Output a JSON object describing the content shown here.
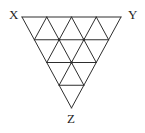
{
  "diagram": {
    "type": "triangular-grid-figure",
    "subdivisions": 4,
    "small_triangle_count": 16,
    "labels": {
      "top_left": "X",
      "top_right": "Y",
      "bottom": "Z"
    },
    "colors": {
      "line": "#2e2e2e",
      "label": "#1f1f1f",
      "background": "#ffffff"
    },
    "vertices": {
      "top_left": [
        22,
        17
      ],
      "top_right": [
        121,
        17
      ],
      "bottom": [
        71.5,
        108
      ]
    }
  }
}
